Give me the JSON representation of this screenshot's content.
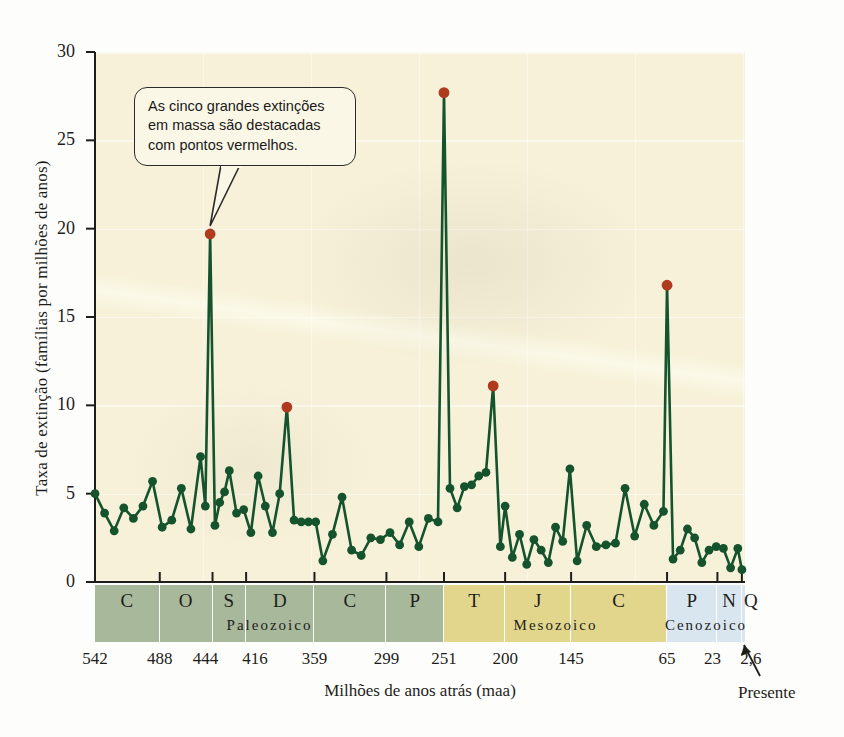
{
  "figure": {
    "background_color": "#fdfdfb",
    "plot_background_color": "#f6f1d8"
  },
  "callout": {
    "text": "As cinco grandes extinções em massa são destacadas com pontos vermelhos.",
    "line1": "As cinco grandes extinções",
    "line2": "em massa são destacadas",
    "line3": "com pontos vermelhos."
  },
  "present_label": "Presente",
  "colors": {
    "line": "#14532c",
    "marker": "#14532c",
    "mass_extinction_marker": "#b03a1e",
    "paleozoic_band": "#a8b89a",
    "mesozoic_band": "#e2d68c",
    "cenozoic_band": "#d9e6ef",
    "axis": "#1d1d1b"
  },
  "chart_data": {
    "type": "line",
    "title": "",
    "xlabel": "Milhões de anos atrás (maa)",
    "ylabel": "Taxa de extinção (famílias por milhões de anos)",
    "ylim": [
      0,
      30
    ],
    "yticks": [
      0,
      5,
      10,
      15,
      20,
      25,
      30
    ],
    "ytick_labels": [
      "0",
      "5",
      "10",
      "15",
      "20",
      "25",
      "30"
    ],
    "xlim_maa": [
      542,
      0
    ],
    "xticks_maa": [
      542,
      488,
      444,
      416,
      359,
      299,
      251,
      200,
      145,
      65,
      23,
      2.6
    ],
    "xtick_labels": [
      "542",
      "488",
      "444",
      "416",
      "359",
      "299",
      "251",
      "200",
      "145",
      "65",
      "23",
      "2,6"
    ],
    "grid": true,
    "legend": "none",
    "series": [
      {
        "name": "Taxa de extinção",
        "x": [
          542,
          534,
          526,
          518,
          510,
          502,
          494,
          486,
          478,
          470,
          462,
          454,
          450,
          446,
          442,
          438,
          434,
          430,
          424,
          418,
          412,
          406,
          400,
          394,
          388,
          382,
          376,
          370,
          364,
          358,
          352,
          344,
          336,
          328,
          320,
          312,
          304,
          296,
          288,
          280,
          272,
          264,
          256,
          251,
          246,
          240,
          234,
          228,
          222,
          216,
          210,
          204,
          200,
          194,
          188,
          182,
          176,
          170,
          164,
          158,
          152,
          146,
          140,
          132,
          124,
          116,
          108,
          100,
          92,
          84,
          76,
          68,
          65,
          60,
          54,
          48,
          42,
          36,
          30,
          24,
          18,
          12,
          6,
          2.6
        ],
        "values": [
          5.0,
          3.9,
          2.9,
          4.2,
          3.6,
          4.3,
          5.7,
          3.1,
          3.5,
          5.3,
          3.0,
          7.1,
          4.3,
          19.7,
          3.2,
          4.5,
          5.1,
          6.3,
          3.9,
          4.1,
          2.8,
          6.0,
          4.3,
          2.8,
          5.0,
          9.9,
          3.5,
          3.4,
          3.4,
          3.4,
          1.2,
          2.7,
          4.8,
          1.8,
          1.5,
          2.5,
          2.4,
          2.8,
          2.1,
          3.4,
          2.0,
          3.6,
          3.4,
          27.7,
          5.3,
          4.2,
          5.4,
          5.5,
          6.0,
          6.2,
          11.1,
          2.0,
          4.3,
          1.4,
          2.7,
          1.0,
          2.4,
          1.8,
          1.1,
          3.1,
          2.3,
          6.4,
          1.2,
          3.2,
          2.0,
          2.1,
          2.2,
          5.3,
          2.6,
          4.4,
          3.2,
          4.0,
          16.8,
          1.3,
          1.8,
          3.0,
          2.5,
          1.1,
          1.8,
          2.0,
          1.9,
          0.8,
          1.9,
          0.7
        ]
      }
    ],
    "mass_extinctions": [
      {
        "label": "Ordoviciano-Siluriano",
        "x": 446,
        "value": 19.7
      },
      {
        "label": "Devoniano tardio",
        "x": 382,
        "value": 9.9
      },
      {
        "label": "Permiano-Triássico",
        "x": 251,
        "value": 27.7
      },
      {
        "label": "Triássico-Jurássico",
        "x": 210,
        "value": 11.1
      },
      {
        "label": "Cretáceo-Paleogeno",
        "x": 65,
        "value": 16.8
      }
    ],
    "eras": [
      {
        "name": "Paleozoico",
        "start_maa": 542,
        "end_maa": 251,
        "color": "#a8b89a"
      },
      {
        "name": "Mesozoico",
        "start_maa": 251,
        "end_maa": 65,
        "color": "#e2d68c"
      },
      {
        "name": "Cenozoico",
        "start_maa": 65,
        "end_maa": 0,
        "color": "#d9e6ef"
      }
    ],
    "periods": [
      {
        "letter": "C",
        "name": "Cambriano",
        "start_maa": 542,
        "end_maa": 488,
        "era": "Paleozoico"
      },
      {
        "letter": "O",
        "name": "Ordoviciano",
        "start_maa": 488,
        "end_maa": 444,
        "era": "Paleozoico"
      },
      {
        "letter": "S",
        "name": "Siluriano",
        "start_maa": 444,
        "end_maa": 416,
        "era": "Paleozoico"
      },
      {
        "letter": "D",
        "name": "Devoniano",
        "start_maa": 416,
        "end_maa": 359,
        "era": "Paleozoico"
      },
      {
        "letter": "C",
        "name": "Carbonífero",
        "start_maa": 359,
        "end_maa": 299,
        "era": "Paleozoico"
      },
      {
        "letter": "P",
        "name": "Permiano",
        "start_maa": 299,
        "end_maa": 251,
        "era": "Paleozoico"
      },
      {
        "letter": "T",
        "name": "Triássico",
        "start_maa": 251,
        "end_maa": 200,
        "era": "Mesozoico"
      },
      {
        "letter": "J",
        "name": "Jurássico",
        "start_maa": 200,
        "end_maa": 145,
        "era": "Mesozoico"
      },
      {
        "letter": "C",
        "name": "Cretáceo",
        "start_maa": 145,
        "end_maa": 65,
        "era": "Mesozoico"
      },
      {
        "letter": "P",
        "name": "Paleogeno",
        "start_maa": 65,
        "end_maa": 23,
        "era": "Cenozoico"
      },
      {
        "letter": "N",
        "name": "Neogeno",
        "start_maa": 23,
        "end_maa": 2.6,
        "era": "Cenozoico"
      },
      {
        "letter": "Q",
        "name": "Quaternário",
        "start_maa": 2.6,
        "end_maa": 0,
        "era": "Cenozoico"
      }
    ]
  }
}
